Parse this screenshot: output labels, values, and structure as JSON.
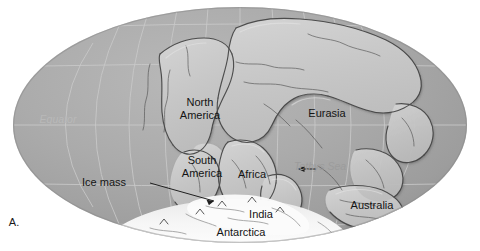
{
  "figure": {
    "panel_letter": "A.",
    "background_color": "#ffffff"
  },
  "map": {
    "projection": "mollweide-oval",
    "ocean_color": "#a9a9a9",
    "land_color": "#c9c9c9",
    "ice_color": "#f2f2f2",
    "graticule_color": "#c4c4c4",
    "ellipse": {
      "center_x": 240,
      "center_y": 125,
      "radius_x": 227,
      "radius_y": 118
    },
    "graticule": {
      "meridians": [
        -150,
        -120,
        -90,
        -60,
        -30,
        0,
        30,
        60,
        90,
        120,
        150
      ],
      "parallels": [
        -60,
        -30,
        0,
        30,
        60
      ]
    }
  },
  "labels": {
    "continents": [
      {
        "name": "north-america",
        "lines": [
          "North",
          "America"
        ],
        "x": 200,
        "y": 108
      },
      {
        "name": "eurasia",
        "lines": [
          "Eurasia"
        ],
        "x": 327,
        "y": 113
      },
      {
        "name": "south-america",
        "lines": [
          "South",
          "America"
        ],
        "x": 202,
        "y": 166
      },
      {
        "name": "africa",
        "lines": [
          "Africa"
        ],
        "x": 252,
        "y": 174
      },
      {
        "name": "india",
        "lines": [
          "India"
        ],
        "x": 261,
        "y": 214
      },
      {
        "name": "antarctica",
        "lines": [
          "Antarctica"
        ],
        "x": 241,
        "y": 232
      },
      {
        "name": "australia",
        "lines": [
          "Australia"
        ],
        "x": 372,
        "y": 205
      }
    ],
    "ocean_features": [
      {
        "name": "tethys-sea",
        "text": "Tethys Sea",
        "x": 320,
        "y": 166,
        "style": "sea"
      },
      {
        "name": "equator",
        "text": "Equator",
        "x": 58,
        "y": 119,
        "style": "equator"
      }
    ],
    "callouts": [
      {
        "name": "ice-mass",
        "text": "Ice mass",
        "x": 104,
        "y": 182
      }
    ]
  }
}
